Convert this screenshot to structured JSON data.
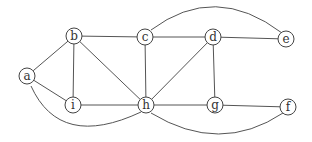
{
  "graph": {
    "nodes": [
      {
        "id": "a",
        "label": "a",
        "x": 27,
        "y": 76
      },
      {
        "id": "b",
        "label": "b",
        "x": 74,
        "y": 36
      },
      {
        "id": "c",
        "label": "c",
        "x": 145,
        "y": 37
      },
      {
        "id": "d",
        "label": "d",
        "x": 213,
        "y": 37
      },
      {
        "id": "e",
        "label": "e",
        "x": 286,
        "y": 39
      },
      {
        "id": "i",
        "label": "i",
        "x": 73,
        "y": 105
      },
      {
        "id": "h",
        "label": "h",
        "x": 146,
        "y": 105
      },
      {
        "id": "g",
        "label": "g",
        "x": 215,
        "y": 105
      },
      {
        "id": "f",
        "label": "f",
        "x": 288,
        "y": 107
      }
    ],
    "edges": [
      {
        "from": "a",
        "to": "b"
      },
      {
        "from": "a",
        "to": "i"
      },
      {
        "from": "a",
        "to": "h",
        "curve": "M31,86 Q60,150 141,112"
      },
      {
        "from": "b",
        "to": "c"
      },
      {
        "from": "b",
        "to": "i"
      },
      {
        "from": "b",
        "to": "h"
      },
      {
        "from": "c",
        "to": "h"
      },
      {
        "from": "c",
        "to": "d"
      },
      {
        "from": "c",
        "to": "e",
        "curve": "M151,30 Q215,-18 282,33"
      },
      {
        "from": "d",
        "to": "e"
      },
      {
        "from": "d",
        "to": "h"
      },
      {
        "from": "d",
        "to": "g"
      },
      {
        "from": "i",
        "to": "h"
      },
      {
        "from": "h",
        "to": "g"
      },
      {
        "from": "g",
        "to": "f"
      },
      {
        "from": "h",
        "to": "f",
        "curve": "M151,113 Q220,155 283,113"
      }
    ],
    "node_radius": 8
  }
}
